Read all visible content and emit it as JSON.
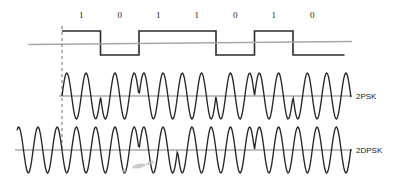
{
  "figure": {
    "width": 408,
    "height": 188,
    "background": "#ffffff"
  },
  "colors": {
    "wave": "#262626",
    "square": "#2b2b2b",
    "axis": "#a8a8a8",
    "dashed_reference": "#6e6e6e",
    "text": "#1a1a1a"
  },
  "chart_data": {
    "type": "line",
    "xlabel": "",
    "ylabel": "",
    "bit_sequence": [
      1,
      0,
      1,
      1,
      0,
      1,
      0
    ],
    "bit_labels": [
      "1",
      "0",
      "1",
      "1",
      "0",
      "1",
      "0"
    ],
    "bit_count": 7,
    "cycles_per_bit": 2,
    "series": [
      {
        "name": "baseband",
        "kind": "square",
        "values": [
          1,
          0,
          1,
          1,
          0,
          1,
          0
        ],
        "label": ""
      },
      {
        "name": "2PSK",
        "kind": "sine-phase",
        "label": "2PSK",
        "phase_deg": [
          0,
          180,
          0,
          0,
          180,
          0,
          180
        ],
        "note": "absolute phase: bit 1 -> 0 deg, bit 0 -> 180 deg"
      },
      {
        "name": "2DPSK",
        "kind": "sine-phase",
        "label": "2DPSK",
        "phase_deg": [
          180,
          180,
          0,
          180,
          180,
          0,
          0
        ],
        "reference_bit": 1,
        "note": "differential phase: bit 1 flips phase, bit 0 keeps phase"
      }
    ],
    "grid": false,
    "legend": "right-inline"
  },
  "labels": {
    "psk": "2PSK",
    "dpsk": "2DPSK"
  },
  "geometry": {
    "origin_x": 62,
    "bit_width": 38.5,
    "square_top_y": 31,
    "square_bottom_y": 55,
    "square_axis_y": 43,
    "psk_axis_y": 96,
    "psk_amplitude": 23,
    "dpsk_axis_y": 150,
    "dpsk_amplitude": 23,
    "bit_label_y": 18,
    "wave_start_x": 17,
    "wave_end_x": 351,
    "label_x": 356
  }
}
